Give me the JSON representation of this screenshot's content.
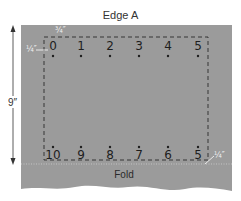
{
  "diagram": {
    "edge_label": "Edge A",
    "fold_label": "Fold",
    "height_dimension": "9″",
    "top_margin_label": "¾″",
    "left_margin_label": "¼″",
    "bottom_right_margin_label": "¼″",
    "top_row_numbers": [
      "0",
      "1",
      "2",
      "3",
      "4",
      "5"
    ],
    "bottom_row_numbers": [
      "10",
      "9",
      "8",
      "7",
      "6",
      "5"
    ],
    "colors": {
      "panel": "#9b9b9b",
      "dashed_line": "#2a2a2a",
      "fold_line": "#bdbdbd",
      "text_dark": "#1e1e1e",
      "fraction_text": "#f2f2f2"
    }
  }
}
